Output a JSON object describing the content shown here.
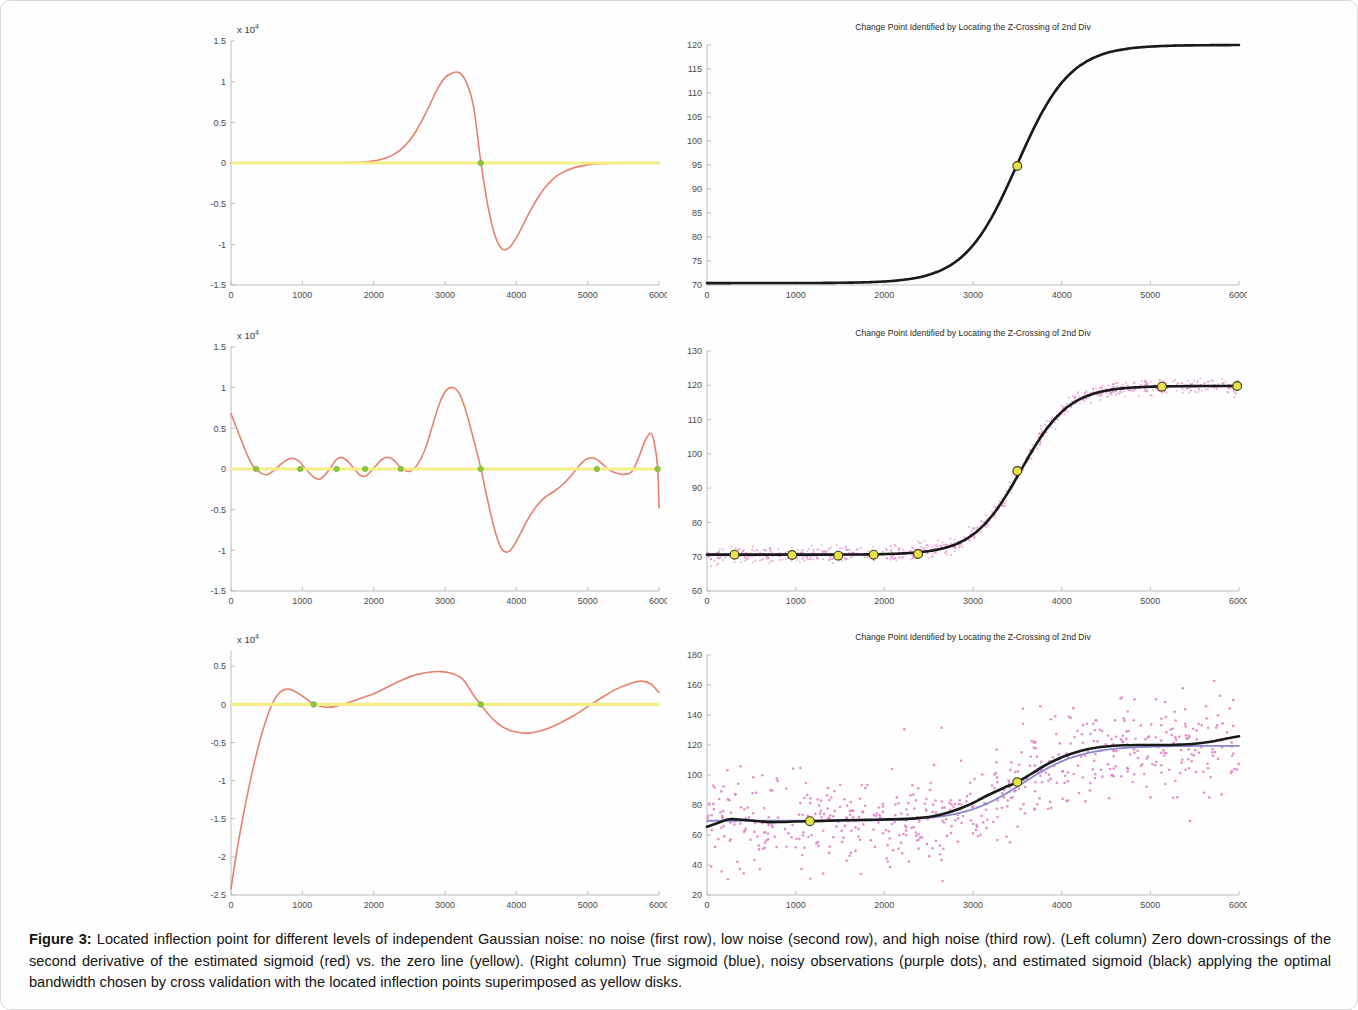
{
  "document": {
    "background_color": "#fefefe",
    "border_color": "#d8d8d8"
  },
  "caption": {
    "label": "Figure 3:",
    "text": " Located inflection point for different levels of independent Gaussian noise: no noise (first row), low noise (second row), and high noise (third row). (Left column) Zero down-crossings of the second derivative of the estimated sigmoid (red) vs. the zero line (yellow). (Right column) True sigmoid (blue), noisy observations (purple dots), and estimated sigmoid (black) applying the optimal bandwidth chosen by cross validation with the located inflection points superimposed as yellow disks."
  },
  "colors": {
    "red_curve": "#e8806b",
    "zero_line": "#f4ee84",
    "black_curve": "#1a1a1a",
    "blue_curve": "#8a86d0",
    "green_marker": "#8cc640",
    "yellow_disk": "#e8e24a",
    "noise_dots": "#e07ac4"
  },
  "chart_data": [
    {
      "id": "row1-left",
      "row": "no-noise",
      "column": "left",
      "type": "line",
      "title": "",
      "xlabel": "",
      "ylabel": "",
      "y_exponent_label": "x 10",
      "y_exponent_sup": "4",
      "xlim": [
        0,
        6000
      ],
      "ylim": [
        -15000,
        15000
      ],
      "xticks": [
        0,
        1000,
        2000,
        3000,
        4000,
        5000,
        6000
      ],
      "yticks": [
        -15000,
        -10000,
        -5000,
        0,
        5000,
        10000,
        15000
      ],
      "ytick_labels": [
        "-1.5",
        "-1",
        "-0.5",
        "0",
        "0.5",
        "1",
        "1.5"
      ],
      "grid": false,
      "series": [
        {
          "name": "second derivative of estimated sigmoid",
          "color": "#e8806b",
          "x": [
            0,
            200,
            400,
            600,
            800,
            1000,
            1200,
            1400,
            1600,
            1800,
            1900,
            2000,
            2100,
            2200,
            2300,
            2400,
            2500,
            2600,
            2700,
            2800,
            2900,
            3000,
            3100,
            3200,
            3300,
            3400,
            3500,
            3600,
            3700,
            3800,
            3900,
            4000,
            4100,
            4200,
            4300,
            4400,
            4500,
            4600,
            4800,
            5000,
            5200,
            5400,
            5600,
            5800,
            6000
          ],
          "y": [
            0,
            0,
            0,
            0,
            0,
            0,
            5,
            15,
            40,
            100,
            160,
            260,
            430,
            700,
            1150,
            1800,
            2750,
            4000,
            5600,
            7400,
            9200,
            10500,
            11050,
            11100,
            9900,
            7000,
            250,
            -5200,
            -8900,
            -10550,
            -10400,
            -9200,
            -7500,
            -5800,
            -4300,
            -3050,
            -2100,
            -1400,
            -600,
            -230,
            -80,
            -25,
            -8,
            -2,
            0
          ]
        },
        {
          "name": "zero line",
          "color": "#f4ee84",
          "x": [
            0,
            6000
          ],
          "y": [
            0,
            0
          ]
        }
      ],
      "markers": {
        "name": "zero down-crossings",
        "color": "#8cc640",
        "points": [
          {
            "x": 3500,
            "y": 0
          }
        ]
      }
    },
    {
      "id": "row1-right",
      "row": "no-noise",
      "column": "right",
      "type": "line",
      "title": "Change Point Identified by Locating the Z-Crossing of 2nd Div",
      "xlabel": "",
      "ylabel": "",
      "xlim": [
        0,
        6000
      ],
      "ylim": [
        70,
        120
      ],
      "xticks": [
        0,
        1000,
        2000,
        3000,
        4000,
        5000,
        6000
      ],
      "yticks": [
        70,
        75,
        80,
        85,
        90,
        95,
        100,
        105,
        110,
        115,
        120
      ],
      "ytick_labels": [
        "70",
        "75",
        "80",
        "85",
        "90",
        "95",
        "100",
        "105",
        "110",
        "115",
        "120"
      ],
      "grid": false,
      "noise_points": 0,
      "noise_sigma": 0,
      "series": [
        {
          "name": "true sigmoid",
          "color": "#8a86d0",
          "sigmoid": {
            "low": 70.4,
            "high": 120,
            "center": 3500,
            "scale": 300
          }
        },
        {
          "name": "estimated sigmoid",
          "color": "#1a1a1a",
          "sigmoid": {
            "low": 70.4,
            "high": 120,
            "center": 3500,
            "scale": 300
          }
        }
      ],
      "markers": {
        "name": "located inflection points",
        "color": "#e8e24a",
        "points": [
          {
            "x": 3500,
            "y": 94.8
          }
        ]
      }
    },
    {
      "id": "row2-left",
      "row": "low-noise",
      "column": "left",
      "type": "line",
      "title": "",
      "xlabel": "",
      "ylabel": "",
      "y_exponent_label": "x 10",
      "y_exponent_sup": "4",
      "xlim": [
        0,
        6000
      ],
      "ylim": [
        -15000,
        15000
      ],
      "xticks": [
        0,
        1000,
        2000,
        3000,
        4000,
        5000,
        6000
      ],
      "yticks": [
        -15000,
        -10000,
        -5000,
        0,
        5000,
        10000,
        15000
      ],
      "ytick_labels": [
        "-1.5",
        "-1",
        "-0.5",
        "0",
        "0.5",
        "1",
        "1.5"
      ],
      "grid": false,
      "series": [
        {
          "name": "second derivative of estimated sigmoid",
          "color": "#e8806b",
          "x": [
            0,
            80,
            160,
            240,
            320,
            360,
            420,
            500,
            600,
            700,
            800,
            880,
            960,
            1000,
            1080,
            1160,
            1240,
            1320,
            1400,
            1480,
            1560,
            1640,
            1720,
            1800,
            1880,
            1960,
            2040,
            2120,
            2200,
            2280,
            2360,
            2440,
            2520,
            2620,
            2720,
            2820,
            2920,
            3020,
            3120,
            3200,
            3280,
            3360,
            3440,
            3500,
            3560,
            3640,
            3720,
            3800,
            3880,
            3960,
            4060,
            4160,
            4280,
            4400,
            4520,
            4640,
            4760,
            4880,
            4980,
            5080,
            5140,
            5220,
            5320,
            5420,
            5520,
            5620,
            5720,
            5800,
            5880,
            5930,
            5980,
            6000
          ],
          "y": [
            6800,
            5000,
            3200,
            1500,
            200,
            0,
            -500,
            -700,
            -200,
            600,
            1200,
            1300,
            900,
            500,
            -300,
            -1000,
            -1250,
            -700,
            200,
            1200,
            1400,
            900,
            100,
            -700,
            -900,
            -300,
            500,
            1200,
            1450,
            1100,
            350,
            -200,
            -250,
            600,
            2400,
            5200,
            8000,
            9700,
            10000,
            9300,
            7500,
            5000,
            2300,
            200,
            -2300,
            -5500,
            -8200,
            -9900,
            -10200,
            -9500,
            -7900,
            -6200,
            -4600,
            -3500,
            -2800,
            -2000,
            -900,
            400,
            1200,
            1350,
            1100,
            500,
            -200,
            -550,
            -650,
            -300,
            1500,
            3400,
            4400,
            3400,
            300,
            -4800
          ]
        },
        {
          "name": "zero line",
          "color": "#f4ee84",
          "x": [
            0,
            6000
          ],
          "y": [
            0,
            0
          ]
        }
      ],
      "markers": {
        "name": "zero down-crossings",
        "color": "#8cc640",
        "points": [
          {
            "x": 350,
            "y": 0
          },
          {
            "x": 970,
            "y": 0
          },
          {
            "x": 1480,
            "y": 0
          },
          {
            "x": 1880,
            "y": 0
          },
          {
            "x": 2380,
            "y": 0
          },
          {
            "x": 3500,
            "y": 0
          },
          {
            "x": 5130,
            "y": 0
          },
          {
            "x": 5980,
            "y": 0
          }
        ]
      }
    },
    {
      "id": "row2-right",
      "row": "low-noise",
      "column": "right",
      "type": "line",
      "title": "Change Point Identified by Locating the Z-Crossing of 2nd Div",
      "xlabel": "",
      "ylabel": "",
      "xlim": [
        0,
        6000
      ],
      "ylim": [
        60,
        130
      ],
      "xticks": [
        0,
        1000,
        2000,
        3000,
        4000,
        5000,
        6000
      ],
      "yticks": [
        60,
        70,
        80,
        90,
        100,
        110,
        120,
        130
      ],
      "ytick_labels": [
        "60",
        "70",
        "80",
        "90",
        "100",
        "110",
        "120",
        "130"
      ],
      "grid": false,
      "noise_points": 900,
      "noise_sigma": 1.1,
      "series": [
        {
          "name": "true sigmoid",
          "color": "#8a86d0",
          "sigmoid": {
            "low": 70.6,
            "high": 119.8,
            "center": 3540,
            "scale": 270
          }
        },
        {
          "name": "estimated sigmoid",
          "color": "#1a1a1a",
          "sigmoid": {
            "low": 70.6,
            "high": 119.8,
            "center": 3540,
            "scale": 270
          }
        }
      ],
      "markers": {
        "name": "located inflection points",
        "color": "#e8e24a",
        "points": [
          {
            "x": 310,
            "y": 70.6
          },
          {
            "x": 960,
            "y": 70.5
          },
          {
            "x": 1480,
            "y": 70.3
          },
          {
            "x": 1880,
            "y": 70.6
          },
          {
            "x": 2380,
            "y": 70.8
          },
          {
            "x": 3500,
            "y": 95.0
          },
          {
            "x": 5130,
            "y": 119.6
          },
          {
            "x": 5980,
            "y": 119.8
          }
        ]
      }
    },
    {
      "id": "row3-left",
      "row": "high-noise",
      "column": "left",
      "type": "line",
      "title": "",
      "xlabel": "",
      "ylabel": "",
      "y_exponent_label": "x 10",
      "y_exponent_sup": "4",
      "xlim": [
        0,
        6000
      ],
      "ylim": [
        -25000,
        7000
      ],
      "xticks": [
        0,
        1000,
        2000,
        3000,
        4000,
        5000,
        6000
      ],
      "yticks": [
        -25000,
        -20000,
        -15000,
        -10000,
        -5000,
        0,
        5000
      ],
      "ytick_labels": [
        "-2.5",
        "-2",
        "-1.5",
        "-1",
        "-0.5",
        "0",
        "0.5"
      ],
      "grid": false,
      "series": [
        {
          "name": "second derivative of estimated sigmoid",
          "color": "#e8806b",
          "x": [
            0,
            60,
            120,
            200,
            280,
            360,
            440,
            520,
            600,
            700,
            800,
            900,
            1000,
            1100,
            1160,
            1250,
            1350,
            1450,
            1550,
            1700,
            1850,
            2000,
            2200,
            2400,
            2600,
            2800,
            2950,
            3100,
            3250,
            3400,
            3500,
            3600,
            3750,
            3900,
            4050,
            4200,
            4400,
            4600,
            4800,
            5000,
            5200,
            5400,
            5600,
            5750,
            5880,
            6000
          ],
          "y": [
            -24200,
            -20500,
            -17200,
            -13200,
            -9600,
            -6400,
            -3600,
            -1300,
            500,
            1700,
            2000,
            1700,
            1100,
            400,
            0,
            -250,
            -380,
            -300,
            -50,
            400,
            900,
            1400,
            2300,
            3200,
            3900,
            4250,
            4300,
            4050,
            3300,
            1200,
            0,
            -1200,
            -2600,
            -3400,
            -3700,
            -3750,
            -3300,
            -2500,
            -1500,
            -300,
            900,
            2000,
            2750,
            3050,
            2700,
            1550
          ]
        },
        {
          "name": "zero line",
          "color": "#f4ee84",
          "x": [
            0,
            6000
          ],
          "y": [
            0,
            0
          ]
        }
      ],
      "markers": {
        "name": "zero down-crossings",
        "color": "#8cc640",
        "points": [
          {
            "x": 1160,
            "y": 0
          },
          {
            "x": 3500,
            "y": 0
          }
        ]
      }
    },
    {
      "id": "row3-right",
      "row": "high-noise",
      "column": "right",
      "type": "line",
      "title": "Change Point Identified by Locating the Z-Crossing of 2nd Div",
      "xlabel": "",
      "ylabel": "",
      "xlim": [
        0,
        6000
      ],
      "ylim": [
        20,
        180
      ],
      "xticks": [
        0,
        1000,
        2000,
        3000,
        4000,
        5000,
        6000
      ],
      "yticks": [
        20,
        40,
        60,
        80,
        100,
        120,
        140,
        160,
        180
      ],
      "ytick_labels": [
        "20",
        "40",
        "60",
        "80",
        "100",
        "120",
        "140",
        "160",
        "180"
      ],
      "grid": false,
      "noise_points": 620,
      "noise_sigma": 16,
      "series": [
        {
          "name": "true sigmoid",
          "color": "#8a86d0",
          "sigmoid": {
            "low": 69.5,
            "high": 119.5,
            "center": 3560,
            "scale": 330
          }
        },
        {
          "name": "estimated sigmoid",
          "color": "#1a1a1a",
          "x": [
            0,
            120,
            250,
            400,
            550,
            700,
            850,
            1000,
            1160,
            1350,
            1550,
            1800,
            2050,
            2300,
            2550,
            2750,
            2950,
            3150,
            3350,
            3500,
            3650,
            3800,
            3950,
            4100,
            4300,
            4500,
            4700,
            4900,
            5100,
            5300,
            5500,
            5700,
            5850,
            6000
          ],
          "y": [
            65.5,
            68.0,
            70.5,
            70.2,
            69.3,
            68.6,
            68.7,
            69.0,
            69.2,
            69.5,
            69.8,
            70.1,
            70.4,
            70.9,
            72.5,
            75.5,
            80.0,
            86.0,
            91.5,
            95.3,
            100.5,
            106.0,
            110.5,
            114.0,
            117.3,
            119.0,
            119.8,
            120.0,
            120.0,
            120.2,
            120.8,
            122.3,
            124.2,
            125.8
          ]
        }
      ],
      "markers": {
        "name": "located inflection points",
        "color": "#e8e24a",
        "points": [
          {
            "x": 1160,
            "y": 69.2
          },
          {
            "x": 3500,
            "y": 95.3
          }
        ]
      }
    }
  ]
}
